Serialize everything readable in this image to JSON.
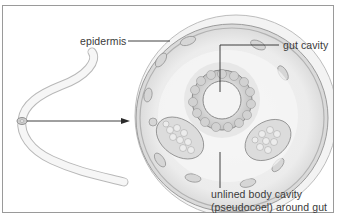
{
  "figure": {
    "labels": {
      "epidermis": "epidermis",
      "gut_cavity": "gut cavity",
      "body_cavity_line1": "unlined body cavity",
      "body_cavity_line2": "(pseudocoel) around gut"
    },
    "colors": {
      "frame_border": "#9a9a9a",
      "line": "#2a2a2a",
      "tissue_light": "#e9e9e9",
      "tissue_mid": "#cfcfcf",
      "tissue_dark": "#a8a8a8",
      "text": "#3a3a3a"
    }
  }
}
